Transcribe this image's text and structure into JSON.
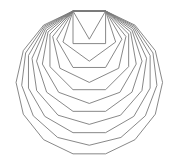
{
  "diagram": {
    "width": 174,
    "height": 163,
    "background": "#ffffff",
    "stroke_color": "#7a7a7a",
    "stroke_width": 0.9,
    "shared_edge": {
      "x1": 73,
      "y1": 11,
      "x2": 105.6,
      "y2": 11
    },
    "polygon_sides": [
      3,
      4,
      5,
      6,
      7,
      8,
      9,
      10,
      11,
      12,
      13,
      14
    ]
  }
}
